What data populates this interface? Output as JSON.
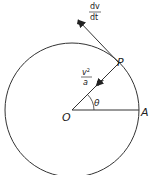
{
  "diagram": {
    "type": "circular-motion",
    "colors": {
      "stroke": "#333333",
      "background": "#ffffff"
    },
    "circle": {
      "cx": 72,
      "cy": 110,
      "r": 67
    },
    "points": {
      "center": {
        "label": "O",
        "x": 72,
        "y": 110
      },
      "point_p": {
        "label": "P",
        "x": 119,
        "y": 63
      },
      "point_a": {
        "label": "A",
        "x": 139,
        "y": 110
      }
    },
    "angle": {
      "label": "θ",
      "from": "OA",
      "to": "OP"
    },
    "vectors": {
      "tangential": {
        "numerator": "dv",
        "denominator": "dt",
        "direction": "tangent"
      },
      "centripetal": {
        "numerator": "v",
        "exponent": "2",
        "denominator": "a",
        "direction": "toward O"
      }
    }
  }
}
